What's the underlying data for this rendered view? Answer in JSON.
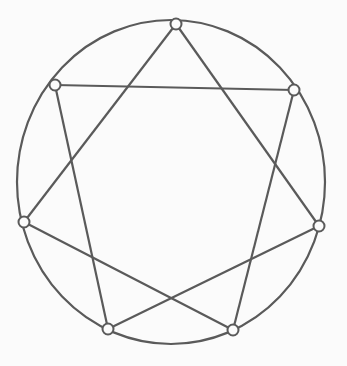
{
  "diagram": {
    "type": "heptagram-in-circle",
    "background": "#fbfbfb",
    "stroke_color": "#5a5a5a",
    "circle": {
      "cx": 171,
      "cy": 182,
      "rx": 154,
      "ry": 162
    },
    "nodes": [
      {
        "id": "n1",
        "x": 176,
        "y": 24
      },
      {
        "id": "n2",
        "x": 294,
        "y": 90
      },
      {
        "id": "n3",
        "x": 319,
        "y": 226
      },
      {
        "id": "n4",
        "x": 233,
        "y": 330
      },
      {
        "id": "n5",
        "x": 108,
        "y": 329
      },
      {
        "id": "n6",
        "x": 24,
        "y": 222
      },
      {
        "id": "n7",
        "x": 55,
        "y": 85
      }
    ],
    "edges": [
      [
        "n1",
        "n6"
      ],
      [
        "n1",
        "n3"
      ],
      [
        "n7",
        "n2"
      ],
      [
        "n7",
        "n5"
      ],
      [
        "n2",
        "n4"
      ],
      [
        "n6",
        "n4"
      ],
      [
        "n3",
        "n5"
      ]
    ]
  }
}
